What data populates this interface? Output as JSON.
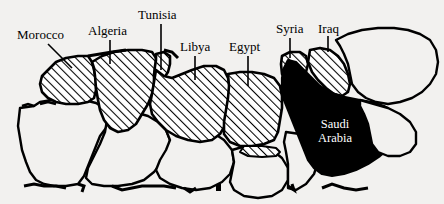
{
  "figure": {
    "name": "north-africa-middle-east-map",
    "background_color": "#f2f1ef",
    "line_color": "#000000",
    "hatch_fill_color": "#000000",
    "solid_fill_color": "#000000",
    "label_color": "#000000",
    "inset_label_color": "#ffffff",
    "width": 444,
    "height": 204
  },
  "labels": [
    {
      "id": "morocco",
      "text": "Morocco",
      "x": 17,
      "y": 28,
      "leader": "diagonal"
    },
    {
      "id": "algeria",
      "text": "Algeria",
      "x": 88,
      "y": 24,
      "leader": "vertical"
    },
    {
      "id": "tunisia",
      "text": "Tunisia",
      "x": 138,
      "y": 8,
      "leader": "vertical"
    },
    {
      "id": "libya",
      "text": "Libya",
      "x": 180,
      "y": 40,
      "leader": "vertical"
    },
    {
      "id": "egypt",
      "text": "Egypt",
      "x": 229,
      "y": 40,
      "leader": "vertical"
    },
    {
      "id": "syria",
      "text": "Syria",
      "x": 276,
      "y": 22,
      "leader": "vertical"
    },
    {
      "id": "iraq",
      "text": "Iraq",
      "x": 318,
      "y": 22,
      "leader": "vertical"
    }
  ],
  "inset_labels": [
    {
      "id": "saudi-arabia",
      "line1": "Saudi",
      "line2": "Arabia",
      "x": 318,
      "y": 117
    }
  ],
  "legend": {
    "hatched_meaning": "hatched-countries",
    "solid_meaning": "solid-filled-country"
  }
}
